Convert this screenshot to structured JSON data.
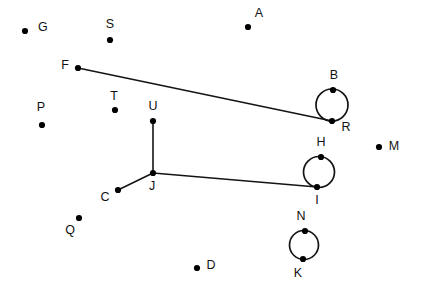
{
  "diagram": {
    "canvas": {
      "width": 432,
      "height": 298,
      "background": "#ffffff"
    },
    "style": {
      "node_color": "#000000",
      "edge_color": "#141414",
      "label_color": "#111111",
      "node_radius": 3.1,
      "edge_width": 1.6
    },
    "nodes": [
      {
        "id": "G",
        "label": "G",
        "x": 25,
        "y": 31,
        "label_x": 38,
        "label_y": 28,
        "anchor": "start"
      },
      {
        "id": "S",
        "label": "S",
        "x": 110,
        "y": 40,
        "label_x": 110,
        "label_y": 25,
        "anchor": "middle"
      },
      {
        "id": "A",
        "label": "A",
        "x": 248,
        "y": 27,
        "label_x": 259,
        "label_y": 14,
        "anchor": "middle"
      },
      {
        "id": "F",
        "label": "F",
        "x": 78,
        "y": 68,
        "label_x": 65,
        "label_y": 66,
        "anchor": "middle"
      },
      {
        "id": "B",
        "label": "B",
        "x": 333,
        "y": 90,
        "label_x": 334,
        "label_y": 76,
        "anchor": "middle"
      },
      {
        "id": "P",
        "label": "P",
        "x": 42,
        "y": 125,
        "label_x": 41,
        "label_y": 108,
        "anchor": "middle"
      },
      {
        "id": "T",
        "label": "T",
        "x": 115,
        "y": 110,
        "label_x": 114,
        "label_y": 97,
        "anchor": "middle"
      },
      {
        "id": "U",
        "label": "U",
        "x": 153,
        "y": 121,
        "label_x": 153,
        "label_y": 107,
        "anchor": "middle"
      },
      {
        "id": "R",
        "label": "R",
        "x": 332,
        "y": 121,
        "label_x": 346,
        "label_y": 128,
        "anchor": "middle"
      },
      {
        "id": "M",
        "label": "M",
        "x": 379,
        "y": 147,
        "label_x": 394,
        "label_y": 147,
        "anchor": "middle"
      },
      {
        "id": "H",
        "label": "H",
        "x": 321,
        "y": 157,
        "label_x": 321,
        "label_y": 143,
        "anchor": "middle"
      },
      {
        "id": "J",
        "label": "J",
        "x": 153,
        "y": 173,
        "label_x": 152,
        "label_y": 187,
        "anchor": "middle"
      },
      {
        "id": "I",
        "label": "I",
        "x": 317,
        "y": 187,
        "label_x": 317,
        "label_y": 201,
        "anchor": "middle"
      },
      {
        "id": "C",
        "label": "C",
        "x": 118,
        "y": 190,
        "label_x": 105,
        "label_y": 198,
        "anchor": "middle"
      },
      {
        "id": "Q",
        "label": "Q",
        "x": 79,
        "y": 218,
        "label_x": 70,
        "label_y": 231,
        "anchor": "middle"
      },
      {
        "id": "N",
        "label": "N",
        "x": 305,
        "y": 231,
        "label_x": 301,
        "label_y": 217,
        "anchor": "middle"
      },
      {
        "id": "K",
        "label": "K",
        "x": 303,
        "y": 259,
        "label_x": 298,
        "label_y": 274,
        "anchor": "middle"
      },
      {
        "id": "D",
        "label": "D",
        "x": 197,
        "y": 268,
        "label_x": 211,
        "label_y": 266,
        "anchor": "middle"
      }
    ],
    "edges": [
      {
        "id": "F-R",
        "from": "F",
        "to": "R",
        "x1": 78,
        "y1": 68,
        "x2": 332,
        "y2": 121
      },
      {
        "id": "U-J",
        "from": "U",
        "to": "J",
        "x1": 153,
        "y1": 121,
        "x2": 153,
        "y2": 173
      },
      {
        "id": "J-C",
        "from": "J",
        "to": "C",
        "x1": 153,
        "y1": 173,
        "x2": 118,
        "y2": 190
      },
      {
        "id": "J-I",
        "from": "J",
        "to": "I",
        "x1": 153,
        "y1": 173,
        "x2": 317,
        "y2": 187
      }
    ],
    "loops": [
      {
        "id": "B-R",
        "top": "B",
        "bottom": "R",
        "cx": 332,
        "cy": 105,
        "r": 16
      },
      {
        "id": "H-I",
        "top": "H",
        "bottom": "I",
        "cx": 319,
        "cy": 172,
        "r": 15.5
      },
      {
        "id": "N-K",
        "top": "N",
        "bottom": "K",
        "cx": 304,
        "cy": 245,
        "r": 14.5
      }
    ]
  }
}
